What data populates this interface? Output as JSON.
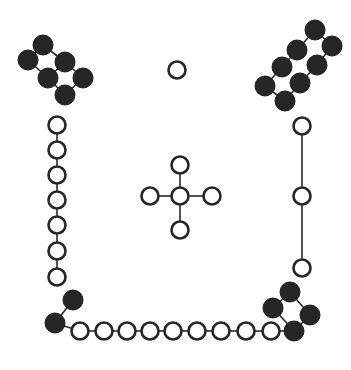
{
  "diagram": {
    "title": "",
    "colors": {
      "ink": "#262626",
      "paper": "#ffffff"
    },
    "radius": {
      "filled": 10,
      "open": 8.5
    },
    "groups": [
      {
        "name": "top-left-filled-cluster",
        "type": "filled",
        "nodes": [
          [
            43,
            45
          ],
          [
            28,
            60
          ],
          [
            65,
            62
          ],
          [
            48,
            78
          ],
          [
            83,
            78
          ],
          [
            65,
            95
          ]
        ],
        "edges": [
          [
            0,
            1
          ],
          [
            0,
            2
          ],
          [
            1,
            3
          ],
          [
            2,
            3
          ],
          [
            2,
            4
          ],
          [
            3,
            5
          ],
          [
            4,
            5
          ]
        ]
      },
      {
        "name": "top-right-filled-cluster",
        "type": "filled",
        "nodes": [
          [
            315,
            30
          ],
          [
            332,
            46
          ],
          [
            297,
            50
          ],
          [
            317,
            65
          ],
          [
            282,
            67
          ],
          [
            300,
            83
          ],
          [
            265,
            86
          ],
          [
            285,
            101
          ]
        ],
        "edges": [
          [
            0,
            1
          ],
          [
            0,
            2
          ],
          [
            2,
            4
          ],
          [
            4,
            6
          ],
          [
            1,
            3
          ],
          [
            3,
            5
          ],
          [
            5,
            7
          ],
          [
            6,
            7
          ]
        ]
      },
      {
        "name": "bottom-right-filled-cluster",
        "type": "filled",
        "nodes": [
          [
            290,
            292
          ],
          [
            273,
            308
          ],
          [
            310,
            315
          ],
          [
            294,
            331
          ]
        ],
        "edges": [
          [
            0,
            1
          ],
          [
            0,
            2
          ],
          [
            2,
            3
          ],
          [
            1,
            3
          ]
        ]
      },
      {
        "name": "bottom-left-filled-pair",
        "type": "filled",
        "nodes": [
          [
            73,
            300
          ],
          [
            55,
            323
          ]
        ],
        "edges": [
          [
            0,
            1
          ]
        ]
      },
      {
        "name": "left-vertical-chain",
        "type": "open",
        "nodes": [
          [
            57,
            125
          ],
          [
            57,
            150
          ],
          [
            57,
            175
          ],
          [
            57,
            200
          ],
          [
            57,
            225
          ],
          [
            57,
            251
          ],
          [
            57,
            277
          ]
        ],
        "edges": [
          [
            0,
            1
          ],
          [
            1,
            2
          ],
          [
            2,
            3
          ],
          [
            3,
            4
          ],
          [
            4,
            5
          ],
          [
            5,
            6
          ]
        ]
      },
      {
        "name": "bottom-horizontal-chain",
        "type": "open",
        "nodes": [
          [
            80,
            331
          ],
          [
            104,
            331
          ],
          [
            127,
            331
          ],
          [
            150,
            331
          ],
          [
            173,
            331
          ],
          [
            197,
            331
          ],
          [
            221,
            331
          ],
          [
            246,
            331
          ],
          [
            271,
            331
          ]
        ],
        "edges": [
          [
            0,
            1
          ],
          [
            1,
            2
          ],
          [
            2,
            3
          ],
          [
            3,
            4
          ],
          [
            4,
            5
          ],
          [
            5,
            6
          ],
          [
            6,
            7
          ],
          [
            7,
            8
          ]
        ]
      },
      {
        "name": "right-vertical-chain",
        "type": "open",
        "nodes": [
          [
            302,
            126
          ],
          [
            302,
            196
          ],
          [
            302,
            268
          ]
        ],
        "edges": [
          [
            0,
            1
          ],
          [
            1,
            2
          ]
        ]
      },
      {
        "name": "center-cross",
        "type": "open",
        "nodes": [
          [
            180,
            196
          ],
          [
            180,
            165
          ],
          [
            180,
            230
          ],
          [
            150,
            196
          ],
          [
            212,
            196
          ]
        ],
        "edges": [
          [
            0,
            1
          ],
          [
            0,
            2
          ],
          [
            0,
            3
          ],
          [
            0,
            4
          ]
        ]
      },
      {
        "name": "lone-ring",
        "type": "open",
        "nodes": [
          [
            177,
            70
          ]
        ],
        "edges": []
      }
    ],
    "links": [
      {
        "name": "bottom-left-pair-to-chain",
        "from": [
          55,
          323
        ],
        "to": [
          80,
          331
        ]
      },
      {
        "name": "chain-to-bottom-right-cluster",
        "from": [
          271,
          331
        ],
        "to": [
          294,
          331
        ]
      }
    ]
  }
}
